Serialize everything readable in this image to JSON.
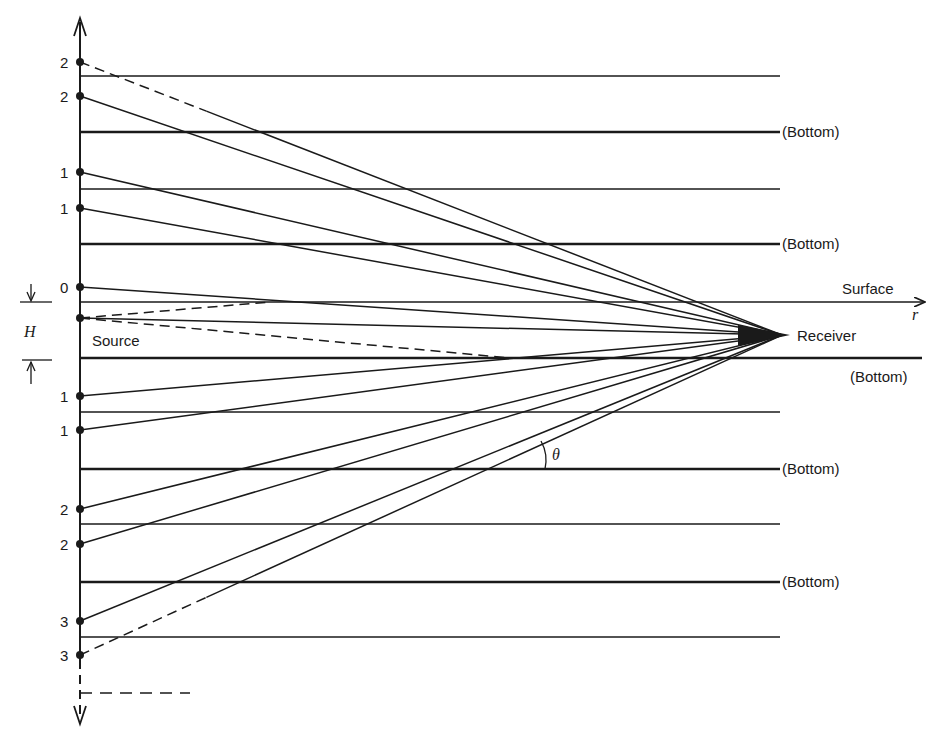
{
  "diagram": {
    "colors": {
      "ink": "#1a1a1a",
      "background": "#ffffff"
    },
    "labels": {
      "surface": "Surface",
      "r_axis": "r",
      "receiver": "Receiver",
      "source": "Source",
      "bottom": "(Bottom)",
      "depth_H": "H",
      "angle": "θ"
    },
    "axis": {
      "x": 80,
      "top": 18,
      "bottom": 722
    },
    "receiver": {
      "x": 786,
      "y": 335
    },
    "source": {
      "x": 80,
      "y": 318
    },
    "layer_lines": [
      {
        "y": 76,
        "thick": false,
        "label": ""
      },
      {
        "y": 132,
        "thick": true,
        "label": "(Bottom)"
      },
      {
        "y": 189,
        "thick": false,
        "label": ""
      },
      {
        "y": 244,
        "thick": true,
        "label": "(Bottom)"
      },
      {
        "y": 302,
        "thick": false,
        "label": "Surface",
        "is_surface": true
      },
      {
        "y": 358,
        "thick": true,
        "label": "(Bottom)",
        "is_true_bottom": true
      },
      {
        "y": 412,
        "thick": false,
        "label": ""
      },
      {
        "y": 469,
        "thick": true,
        "label": "(Bottom)"
      },
      {
        "y": 524,
        "thick": false,
        "label": ""
      },
      {
        "y": 582,
        "thick": true,
        "label": "(Bottom)"
      },
      {
        "y": 637,
        "thick": false,
        "label": ""
      }
    ],
    "image_sources": [
      {
        "order": "2",
        "y": 62,
        "dashed_start": true
      },
      {
        "order": "2",
        "y": 96
      },
      {
        "order": "1",
        "y": 172
      },
      {
        "order": "1",
        "y": 208
      },
      {
        "order": "0",
        "y": 287
      },
      {
        "order": "",
        "y": 318,
        "is_source": true
      },
      {
        "order": "1",
        "y": 396
      },
      {
        "order": "1",
        "y": 430
      },
      {
        "order": "2",
        "y": 509
      },
      {
        "order": "2",
        "y": 544
      },
      {
        "order": "3",
        "y": 621
      },
      {
        "order": "3",
        "y": 655,
        "dashed_start": true
      }
    ]
  }
}
